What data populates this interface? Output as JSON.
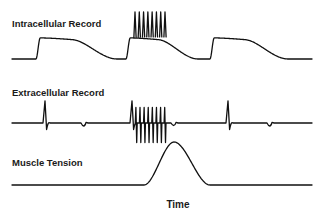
{
  "chart_data": {
    "type": "line",
    "title": "",
    "xlabel": "Time",
    "ylabel": "",
    "x_range": [
      0,
      100
    ],
    "grid": false,
    "legend": "none",
    "colors": {
      "trace": "#111111",
      "background": "#ffffff",
      "text": "#1a1a1a"
    },
    "panels": [
      {
        "name": "Intracellular Record",
        "y_range": [
          0,
          1
        ],
        "description": "Membrane potential: slow depolarizing plateaus; middle plateau carries a burst of action potentials",
        "baseline": 0,
        "plateaus": [
          {
            "start": 8,
            "end": 35,
            "level": 0.45
          },
          {
            "start": 38,
            "end": 62,
            "level": 0.45
          },
          {
            "start": 66,
            "end": 92,
            "level": 0.45
          }
        ],
        "spike_burst": {
          "start": 41,
          "end": 51,
          "count": 8,
          "peak": 1.0
        }
      },
      {
        "name": "Extracellular Record",
        "y_range": [
          -1,
          1
        ],
        "description": "Extracellular potential: single biphasic spikes at each plateau onset, a high-frequency burst during the middle plateau, small dips at plateau ends",
        "baseline": 0,
        "single_spikes": [
          {
            "x": 11,
            "peak": 0.85
          },
          {
            "x": 72,
            "peak": 0.85
          }
        ],
        "spike_burst": {
          "start": 40,
          "end": 51,
          "count": 8,
          "peak": 0.6,
          "trough": -0.75
        },
        "small_dips": [
          {
            "x": 24,
            "depth": -0.12
          },
          {
            "x": 54,
            "depth": -0.1
          },
          {
            "x": 86,
            "depth": -0.12
          }
        ]
      },
      {
        "name": "Muscle Tension",
        "y_range": [
          0,
          1
        ],
        "description": "Single tension transient following the spike burst",
        "baseline": 0,
        "peak": {
          "x": 54,
          "value": 1.0,
          "start": 44,
          "end": 66
        }
      }
    ]
  }
}
